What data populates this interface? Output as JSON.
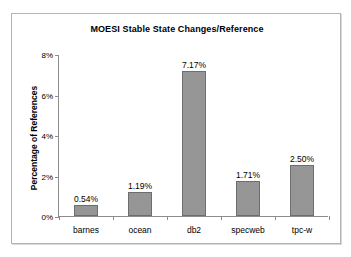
{
  "chart_data": {
    "type": "bar",
    "title": "MOESI Stable State Changes/Reference",
    "xlabel": "",
    "ylabel": "Percentage of References",
    "categories": [
      "barnes",
      "ocean",
      "db2",
      "specweb",
      "tpc-w"
    ],
    "values": [
      0.54,
      1.19,
      7.17,
      1.71,
      2.5
    ],
    "value_labels": [
      "0.54%",
      "1.19%",
      "7.17%",
      "1.71%",
      "2.50%"
    ],
    "ylim": [
      0,
      8
    ],
    "ytick_values": [
      0,
      2,
      4,
      6,
      8
    ],
    "ytick_labels": [
      "0%",
      "2%",
      "4%",
      "6%",
      "8%"
    ],
    "grid": false,
    "legend": false,
    "bar_color": "#969696",
    "bar_edge_color": "#6e6e6e",
    "axis_color": "#8c8c8c",
    "frame_color": "#b4b4b4",
    "background": "#ffffff",
    "text_color": "#000000"
  }
}
